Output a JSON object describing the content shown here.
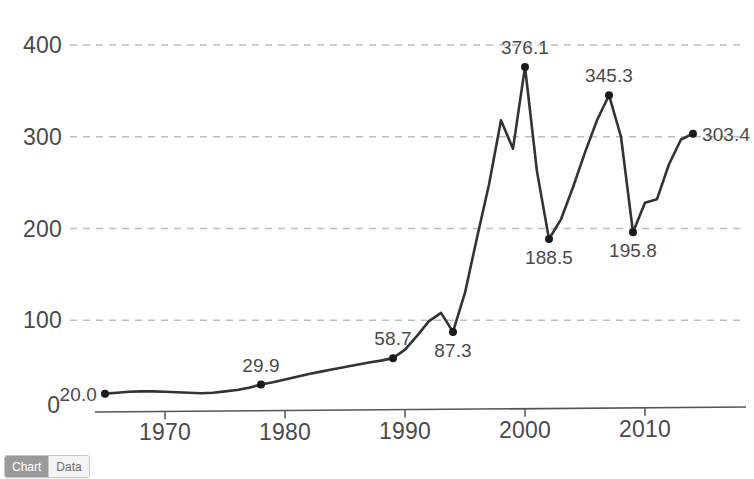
{
  "tabs": {
    "items": [
      {
        "label": "Chart",
        "active": true
      },
      {
        "label": "Data",
        "active": false
      }
    ]
  },
  "chart_data": {
    "type": "line",
    "title": "",
    "subtitle": "",
    "xlabel": "",
    "ylabel": "",
    "xlim": [
      1965,
      2014
    ],
    "ylim": [
      0,
      420
    ],
    "grid": true,
    "legend": false,
    "y_ticks": [
      "400",
      "300",
      "200",
      "100",
      "0"
    ],
    "y_tick_values": [
      400,
      300,
      200,
      100,
      0
    ],
    "x_ticks": [
      "1970",
      "1980",
      "1990",
      "2000",
      "2010"
    ],
    "x_tick_values": [
      1970,
      1980,
      1990,
      2000,
      2010
    ],
    "series": [
      {
        "name": "series-1",
        "color": "#333333",
        "x": [
          1965,
          1966,
          1967,
          1968,
          1969,
          1970,
          1971,
          1972,
          1973,
          1974,
          1975,
          1976,
          1977,
          1978,
          1979,
          1980,
          1981,
          1982,
          1983,
          1984,
          1985,
          1986,
          1987,
          1988,
          1989,
          1990,
          1991,
          1992,
          1993,
          1994,
          1995,
          1996,
          1997,
          1998,
          1999,
          2000,
          2001,
          2002,
          2003,
          2004,
          2005,
          2006,
          2007,
          2008,
          2009,
          2010,
          2011,
          2012,
          2013,
          2014
        ],
        "values": [
          20.0,
          21.0,
          22.0,
          22.5,
          22.5,
          22.0,
          21.5,
          21.0,
          20.5,
          21.0,
          22.5,
          24.0,
          26.5,
          29.9,
          32.5,
          35.5,
          38.5,
          41.5,
          44.0,
          46.5,
          49.0,
          51.5,
          54.0,
          56.0,
          58.7,
          68.0,
          83.0,
          99.0,
          108.0,
          87.3,
          130.0,
          190.0,
          248.0,
          318.0,
          287.0,
          376.1,
          262.0,
          188.5,
          210.0,
          245.0,
          283.0,
          318.0,
          345.3,
          300.0,
          195.8,
          228.0,
          232.0,
          270.0,
          297.0,
          303.4
        ]
      }
    ],
    "labeled_points": [
      {
        "x": 1965,
        "y": 20.0,
        "label": "20.0",
        "anchor": "left"
      },
      {
        "x": 1978,
        "y": 29.9,
        "label": "29.9",
        "anchor": "above"
      },
      {
        "x": 1989,
        "y": 58.7,
        "label": "58.7",
        "anchor": "above"
      },
      {
        "x": 1994,
        "y": 87.3,
        "label": "87.3",
        "anchor": "below"
      },
      {
        "x": 2000,
        "y": 376.1,
        "label": "376.1",
        "anchor": "above"
      },
      {
        "x": 2002,
        "y": 188.5,
        "label": "188.5",
        "anchor": "below"
      },
      {
        "x": 2007,
        "y": 345.3,
        "label": "345.3",
        "anchor": "above"
      },
      {
        "x": 2009,
        "y": 195.8,
        "label": "195.8",
        "anchor": "below"
      },
      {
        "x": 2014,
        "y": 303.4,
        "label": "303.4",
        "anchor": "right"
      }
    ],
    "colors": {
      "line": "#333333",
      "marker": "#1a1a1a",
      "gridline": "#bdbdbd",
      "axis": "#555555",
      "text": "#4a4a4a",
      "background": "#ffffff"
    }
  }
}
